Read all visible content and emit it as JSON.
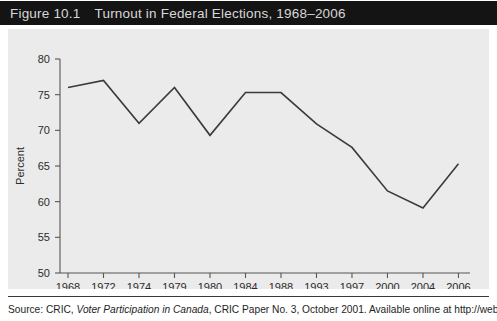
{
  "figure": {
    "number_label": "Figure 10.1",
    "title": "Turnout in Federal Elections, 1968–2006",
    "source_prefix": "Source: CRIC, ",
    "source_italic": "Voter Participation in Canada",
    "source_suffix": ", CRIC Paper No. 3, October 2001. Available online at http://web"
  },
  "colors": {
    "title_bar_bg": "#141414",
    "title_text": "#d8d8d8",
    "panel_bg": "#ebebeb",
    "line": "#3a3a3a",
    "axis": "#555555"
  },
  "chart_data": {
    "type": "line",
    "title": "Turnout in Federal Elections, 1968–2006",
    "xlabel": "",
    "ylabel": "Percent",
    "categories": [
      "1968",
      "1972",
      "1974",
      "1979",
      "1980",
      "1984",
      "1988",
      "1993",
      "1997",
      "2000",
      "2004",
      "2006"
    ],
    "values": [
      76.0,
      77.0,
      71.0,
      76.0,
      69.3,
      75.3,
      75.3,
      70.9,
      67.6,
      61.5,
      59.1,
      65.3
    ],
    "ylim": [
      50,
      80
    ],
    "yticks": [
      50,
      55,
      60,
      65,
      70,
      75,
      80
    ],
    "ytick_labels": [
      "50",
      "55",
      "60",
      "65",
      "70",
      "75",
      "80"
    ],
    "grid": false,
    "legend": "none",
    "series_name": "Voter turnout"
  }
}
